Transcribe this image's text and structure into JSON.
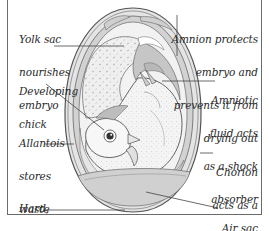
{
  "diagram": {
    "labels": {
      "yolk_sac": [
        "Yolk sac",
        "nourishes",
        "embryo"
      ],
      "developing_chick": [
        "Developing",
        "chick"
      ],
      "allantois": [
        "Allantois",
        "stores",
        "waste"
      ],
      "shell": [
        "Hard,",
        "protective",
        "shell"
      ],
      "amnion": [
        "Amnion protects",
        "embryo and",
        "prevents it from",
        "drying out"
      ],
      "amniotic_fluid": [
        "Amniotic",
        "fluid acts",
        "as a shock",
        "absorber"
      ],
      "chorion": [
        "Chorion",
        "acts as a",
        "respiratory",
        "surface"
      ],
      "air_sac": [
        "Air sac"
      ]
    },
    "colors": {
      "frame": "#6b6b6b",
      "text": "#2a2a2a",
      "shell_outline": "#555555",
      "gray_fill": "#c9c9c9",
      "light_fill": "#eeeeee",
      "leader_line": "#444444"
    }
  }
}
